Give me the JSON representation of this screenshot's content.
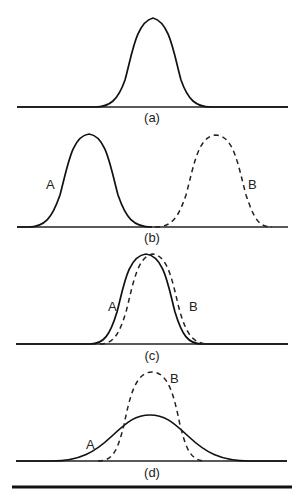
{
  "figure": {
    "panels": [
      {
        "id": "a",
        "caption": "(a)",
        "curves": []
      },
      {
        "id": "b",
        "caption": "(b)",
        "curves": [
          {
            "label": "A",
            "style": "solid"
          },
          {
            "label": "B",
            "style": "dashed"
          }
        ]
      },
      {
        "id": "c",
        "caption": "(c)",
        "curves": [
          {
            "label": "A",
            "style": "solid"
          },
          {
            "label": "B",
            "style": "dashed"
          }
        ]
      },
      {
        "id": "d",
        "caption": "(d)",
        "curves": [
          {
            "label": "A",
            "style": "solid"
          },
          {
            "label": "B",
            "style": "dashed"
          }
        ]
      }
    ]
  },
  "colors": {
    "line": "#111111",
    "background": "#ffffff"
  }
}
